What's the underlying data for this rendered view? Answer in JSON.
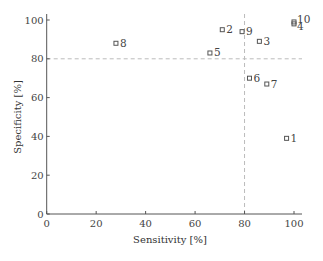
{
  "chart_data": {
    "type": "scatter",
    "title": "",
    "xlabel": "Sensitivity [%]",
    "ylabel": "Specificity [%]",
    "xlim": [
      0,
      100
    ],
    "ylim": [
      0,
      100
    ],
    "x_ticks": [
      0,
      20,
      40,
      60,
      80,
      100
    ],
    "y_ticks": [
      0,
      20,
      40,
      60,
      80,
      100
    ],
    "grid": false,
    "legend": null,
    "reference_lines": [
      {
        "orientation": "vertical",
        "x": 80,
        "style": "dashed"
      },
      {
        "orientation": "horizontal",
        "y": 80,
        "style": "dashed"
      }
    ],
    "marker": "square-open",
    "points": [
      {
        "label": "1",
        "x": 97,
        "y": 39
      },
      {
        "label": "2",
        "x": 71,
        "y": 95
      },
      {
        "label": "3",
        "x": 86,
        "y": 89
      },
      {
        "label": "4",
        "x": 100,
        "y": 98
      },
      {
        "label": "5",
        "x": 66,
        "y": 83
      },
      {
        "label": "6",
        "x": 82,
        "y": 70
      },
      {
        "label": "7",
        "x": 89,
        "y": 67
      },
      {
        "label": "8",
        "x": 28,
        "y": 88
      },
      {
        "label": "9",
        "x": 79,
        "y": 94
      },
      {
        "label": "10",
        "x": 100,
        "y": 99
      }
    ]
  },
  "colors": {
    "axis": "#555555",
    "marker": "#555555",
    "reference_line": "#bbbbbb",
    "text": "#444444"
  }
}
